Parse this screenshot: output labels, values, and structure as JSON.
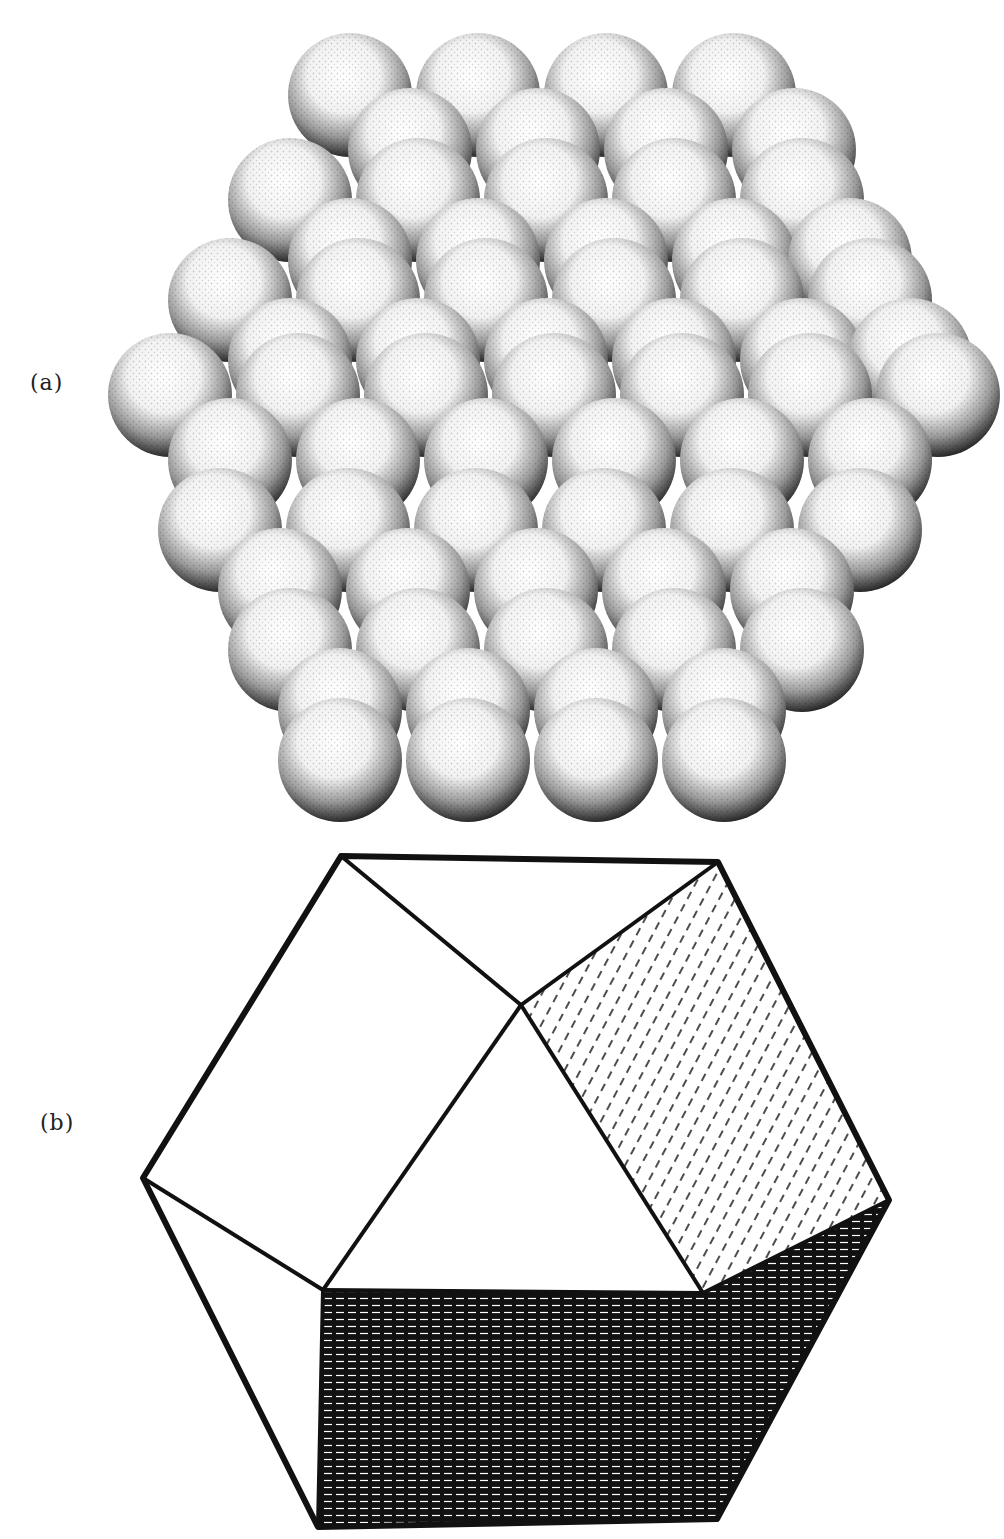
{
  "figure": {
    "panels": [
      {
        "label": "(a)",
        "description": "Stippled drawing of a close-packed cluster of spheres forming a rhombic dodecahedron shape"
      },
      {
        "label": "(b)",
        "description": "Line drawing of a rhombic dodecahedron with hatched shading on lower and right faces"
      }
    ]
  },
  "colors": {
    "ink": "#111111",
    "paper": "#ffffff",
    "sphere_shadow": "#2a2a2a"
  },
  "spheres": {
    "radius": 62,
    "rows": [
      {
        "y": 95,
        "xs": [
          350,
          478,
          606,
          734
        ]
      },
      {
        "y": 150,
        "xs": [
          410,
          538,
          666,
          794
        ]
      },
      {
        "y": 200,
        "xs": [
          290,
          418,
          546,
          674,
          802
        ]
      },
      {
        "y": 260,
        "xs": [
          350,
          478,
          606,
          734,
          850
        ]
      },
      {
        "y": 300,
        "xs": [
          230,
          358,
          486,
          614,
          742,
          870
        ]
      },
      {
        "y": 360,
        "xs": [
          290,
          418,
          546,
          674,
          802,
          910
        ]
      },
      {
        "y": 395,
        "xs": [
          170,
          298,
          426,
          554,
          682,
          810,
          938
        ]
      },
      {
        "y": 460,
        "xs": [
          230,
          358,
          486,
          614,
          742,
          870
        ]
      },
      {
        "y": 530,
        "xs": [
          220,
          348,
          476,
          604,
          732,
          860
        ]
      },
      {
        "y": 590,
        "xs": [
          280,
          408,
          536,
          664,
          792
        ]
      },
      {
        "y": 650,
        "xs": [
          290,
          418,
          546,
          674,
          802
        ]
      },
      {
        "y": 710,
        "xs": [
          340,
          468,
          596,
          724
        ]
      },
      {
        "y": 760,
        "xs": [
          340,
          468,
          596,
          724
        ]
      }
    ]
  },
  "polyhedron": {
    "outline": "341,856 718,862 889,1200 717,1519 318,1527 143,1178",
    "edges": [
      "341,856 521,1005",
      "718,862 521,1005",
      "521,1005 323,1290",
      "521,1005 703,1293",
      "143,1178 323,1290",
      "703,1293 889,1200",
      "323,1290 703,1293",
      "323,1290 318,1527"
    ],
    "dark_face": "323,1290 703,1293 889,1200 717,1519 318,1527",
    "right_light_face": "718,862 889,1200 703,1293 521,1005"
  }
}
